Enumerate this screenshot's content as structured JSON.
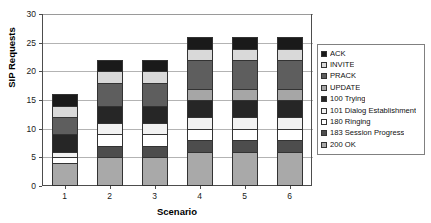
{
  "chart_data": {
    "type": "bar",
    "subtype": "stacked-column",
    "title": "",
    "xlabel": "Scenario",
    "ylabel": "SIP Requests",
    "categories": [
      "1",
      "2",
      "3",
      "4",
      "5",
      "6"
    ],
    "ylim": [
      0,
      30
    ],
    "yticks": [
      0,
      5,
      10,
      15,
      20,
      25,
      30
    ],
    "grid": true,
    "legend_position": "right",
    "totals": [
      16,
      22,
      22,
      26,
      26,
      26
    ],
    "stack_order_bottom_to_top": [
      "200 OK",
      "183 Session Progress",
      "180 Ringing",
      "101 Dialog Establishment",
      "100 Trying",
      "UPDATE",
      "PRACK",
      "INVITE",
      "ACK"
    ],
    "series": [
      {
        "name": "ACK",
        "color": "#1a1a1a",
        "values": [
          2,
          2,
          2,
          2,
          2,
          2
        ]
      },
      {
        "name": "INVITE",
        "color": "#d9d9d9",
        "values": [
          2,
          2,
          2,
          2,
          2,
          2
        ]
      },
      {
        "name": "PRACK",
        "color": "#5e5e5e",
        "values": [
          3,
          4,
          4,
          5,
          5,
          5
        ]
      },
      {
        "name": "UPDATE",
        "color": "#a6a6a6",
        "values": [
          0,
          0,
          0,
          2,
          2,
          2
        ]
      },
      {
        "name": "100 Trying",
        "color": "#262626",
        "values": [
          3,
          3,
          3,
          3,
          3,
          3
        ]
      },
      {
        "name": "101 Dialog Establishment",
        "color": "#f2f2f2",
        "values": [
          1,
          2,
          2,
          2,
          2,
          2
        ]
      },
      {
        "name": "180 Ringing",
        "color": "#ffffff",
        "values": [
          1,
          2,
          2,
          2,
          2,
          2
        ]
      },
      {
        "name": "183 Session Progress",
        "color": "#4d4d4d",
        "values": [
          0,
          2,
          2,
          2,
          2,
          2
        ]
      },
      {
        "name": "200 OK",
        "color": "#a9a9a9",
        "values": [
          4,
          5,
          5,
          6,
          6,
          6
        ]
      }
    ]
  },
  "legend": {
    "items": [
      {
        "label": "ACK",
        "color": "#1a1a1a"
      },
      {
        "label": "INVITE",
        "color": "#d9d9d9"
      },
      {
        "label": "PRACK",
        "color": "#5e5e5e"
      },
      {
        "label": "UPDATE",
        "color": "#a6a6a6"
      },
      {
        "label": "100 Trying",
        "color": "#262626"
      },
      {
        "label": "101 Dialog Establishment",
        "color": "#f2f2f2"
      },
      {
        "label": "180 Ringing",
        "color": "#ffffff"
      },
      {
        "label": "183 Session Progress",
        "color": "#4d4d4d"
      },
      {
        "label": "200 OK",
        "color": "#a9a9a9"
      }
    ]
  }
}
